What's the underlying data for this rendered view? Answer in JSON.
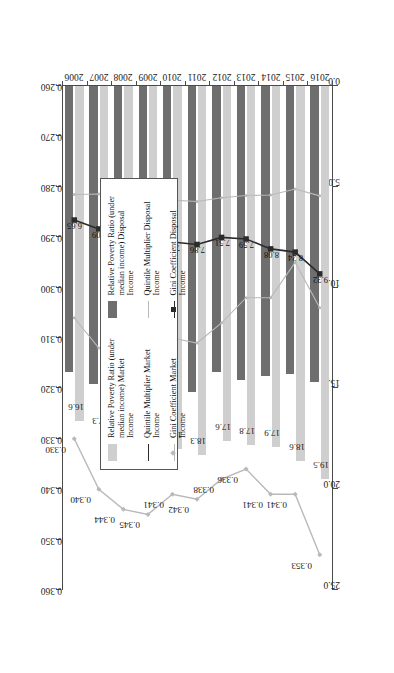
{
  "figure": {
    "caption": "Figure 2.3   Changes in income distribution in Korea (unit: %, times)"
  },
  "axes": {
    "primary_ticks": [
      "25.0",
      "20.0",
      "15.0",
      "10.0",
      "5.0",
      "0.0"
    ],
    "secondary_ticks": [
      "0.360",
      "0.350",
      "0.340",
      "0.330",
      "0.320",
      "0.310",
      "0.300",
      "0.290",
      "0.280",
      "0.270",
      "0.260"
    ]
  },
  "legend": {
    "items": [
      {
        "label": "Relative Poverty Ratio (under median income) Disposal Income",
        "marker": "bar-dark"
      },
      {
        "label": "Quintile Multiplier Disposal Income",
        "marker": "line-light"
      },
      {
        "label": "Gini Coefficient Disposal Income",
        "marker": "line-dark-square"
      },
      {
        "label": "Relative Poverty Ratio (under median income) Market Income",
        "marker": "bar-light"
      },
      {
        "label": "Quintile Multiplier Market Income",
        "marker": "line-dark"
      },
      {
        "label": "Gini Coefficient Market Income",
        "marker": "line-light-diamond"
      }
    ]
  },
  "colors": {
    "bar_market": "#cfcfcf",
    "bar_disposal": "#6e6e6e",
    "line_dark": "#2b2b2b",
    "line_light": "#b9b9b9",
    "axis": "#4a4a4a"
  },
  "chart_data": {
    "type": "bar",
    "xlabel": "",
    "ylabel": "unit: %, times",
    "categories": [
      "2006",
      "2007",
      "2008",
      "2009",
      "2010",
      "2011",
      "2012",
      "2013",
      "2014",
      "2015",
      "2016"
    ],
    "xlim": [
      0.0,
      25.0
    ],
    "secondary_ylim": [
      0.26,
      0.36
    ],
    "grid": false,
    "legend_position": "right",
    "series": [
      {
        "name": "Relative Poverty Ratio (under median income) Market Income",
        "kind": "bar",
        "axis": "primary",
        "values": [
          16.6,
          17.3,
          17.5,
          18.1,
          18.0,
          18.3,
          17.6,
          17.8,
          17.9,
          18.6,
          19.5
        ],
        "labels": [
          "16.6",
          "17.3",
          "17.5",
          "18.1",
          "18.0",
          "18.3",
          "17.6",
          "17.8",
          "17.9",
          "18.6",
          "19.5"
        ]
      },
      {
        "name": "Relative Poverty Ratio (under median income) Disposal Income",
        "kind": "bar",
        "axis": "primary",
        "values": [
          14.2,
          14.8,
          14.5,
          15.3,
          14.9,
          15.2,
          14.2,
          14.6,
          14.4,
          14.3,
          14.7
        ],
        "labels": [
          "",
          "",
          "",
          "",
          "",
          "",
          "",
          "",
          "",
          "",
          ""
        ]
      },
      {
        "name": "Quintile Multiplier Market Income",
        "kind": "line",
        "axis": "primary",
        "values": [
          6.65,
          7.09,
          7.38,
          7.7,
          7.74,
          7.86,
          7.51,
          7.59,
          8.08,
          8.24,
          9.32
        ],
        "labels": [
          "6.65",
          "7.09",
          "7.38",
          "7.70",
          "7.74",
          "7.86",
          "7.51",
          "7.59",
          "8.08",
          "8.24",
          "9.32"
        ]
      },
      {
        "name": "Quintile Multiplier Disposal Income",
        "kind": "line",
        "axis": "primary",
        "values": [
          5.38,
          5.36,
          5.41,
          5.75,
          5.66,
          5.73,
          5.54,
          5.43,
          5.41,
          5.11,
          5.45
        ],
        "labels": [
          "",
          "",
          "",
          "",
          "",
          "",
          "",
          "",
          "",
          "",
          ""
        ]
      },
      {
        "name": "Gini Coefficient Market Income",
        "kind": "line",
        "axis": "secondary",
        "values": [
          0.33,
          0.34,
          0.344,
          0.345,
          0.341,
          0.342,
          0.338,
          0.336,
          0.341,
          0.341,
          0.353
        ],
        "labels": [
          "0.330",
          "0.340",
          "0.344",
          "0.345",
          "0.341",
          "0.342",
          "0.338",
          "0.336",
          "0.341",
          "0.341",
          "0.353"
        ]
      },
      {
        "name": "Gini Coefficient Disposal Income",
        "kind": "line",
        "axis": "secondary",
        "values": [
          0.306,
          0.312,
          0.314,
          0.314,
          0.31,
          0.311,
          0.307,
          0.302,
          0.302,
          0.295,
          0.304
        ],
        "labels": [
          "",
          "",
          "",
          "",
          "",
          "",
          "",
          "",
          "",
          "",
          ""
        ]
      }
    ]
  }
}
